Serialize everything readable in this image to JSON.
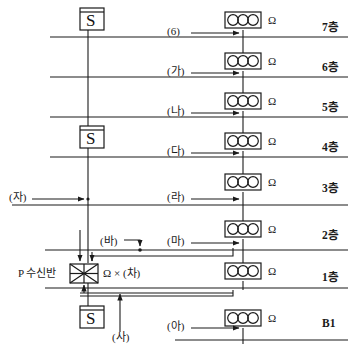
{
  "diagram": {
    "floors": [
      {
        "label": "7층",
        "y": 22
      },
      {
        "label": "6층",
        "y": 62
      },
      {
        "label": "5층",
        "y": 102
      },
      {
        "label": "4층",
        "y": 142
      },
      {
        "label": "3층",
        "y": 183
      },
      {
        "label": "2층",
        "y": 230
      },
      {
        "label": "1층",
        "y": 272
      },
      {
        "label": "B1",
        "y": 318
      }
    ],
    "floor_lines_y": [
      37,
      77,
      117,
      157,
      205,
      250,
      288,
      340
    ],
    "bells": [
      {
        "name": "bell-7f",
        "x": 225,
        "y": 12,
        "ohm": "Ω"
      },
      {
        "name": "bell-6f",
        "x": 225,
        "y": 53,
        "ohm": "Ω"
      },
      {
        "name": "bell-5f",
        "x": 225,
        "y": 93,
        "ohm": "Ω"
      },
      {
        "name": "bell-4f",
        "x": 225,
        "y": 133,
        "ohm": "Ω"
      },
      {
        "name": "bell-3f",
        "x": 225,
        "y": 174,
        "ohm": "Ω"
      },
      {
        "name": "bell-2f",
        "x": 225,
        "y": 221,
        "ohm": "Ω"
      },
      {
        "name": "bell-1f",
        "x": 225,
        "y": 263,
        "ohm": "Ω"
      },
      {
        "name": "bell-b1",
        "x": 225,
        "y": 310,
        "ohm": "Ω"
      }
    ],
    "tags": [
      {
        "id": "tag-6",
        "label": "(6)",
        "x": 167,
        "y": 30
      },
      {
        "id": "tag-ga",
        "label": "(가)",
        "x": 167,
        "y": 70
      },
      {
        "id": "tag-na",
        "label": "(나)",
        "x": 167,
        "y": 110
      },
      {
        "id": "tag-da",
        "label": "(다)",
        "x": 167,
        "y": 150
      },
      {
        "id": "tag-ra",
        "label": "(라)",
        "x": 167,
        "y": 196
      },
      {
        "id": "tag-ma",
        "label": "(마)",
        "x": 167,
        "y": 240
      },
      {
        "id": "tag-ba",
        "label": "(바)",
        "x": 100,
        "y": 240
      },
      {
        "id": "tag-ah",
        "label": "(아)",
        "x": 167,
        "y": 325
      },
      {
        "id": "tag-ja",
        "label": "(자)",
        "x": 9,
        "y": 196
      },
      {
        "id": "tag-sa",
        "label": "(사)",
        "x": 112,
        "y": 336
      },
      {
        "id": "tag-cha",
        "label": "Ω × (차)",
        "x": 99,
        "y": 273
      }
    ],
    "panel": {
      "label": "P 수신반",
      "label_x": 20,
      "label_y": 273,
      "box_x": 70,
      "box_y": 265,
      "box_w": 27,
      "box_h": 18
    },
    "detectors": [
      {
        "name": "detector-top",
        "letter": "S",
        "x": 80,
        "y": 8
      },
      {
        "name": "detector-mid",
        "letter": "S",
        "x": 80,
        "y": 126
      },
      {
        "name": "detector-bottom",
        "letter": "S",
        "x": 80,
        "y": 306
      }
    ],
    "risers": [
      {
        "name": "detector-riser",
        "x": 88
      },
      {
        "name": "bell-riser",
        "x": 243
      }
    ],
    "colors": {
      "line": "#1a1a1a",
      "text": "#1a1a1a",
      "background": "#ffffff"
    }
  }
}
